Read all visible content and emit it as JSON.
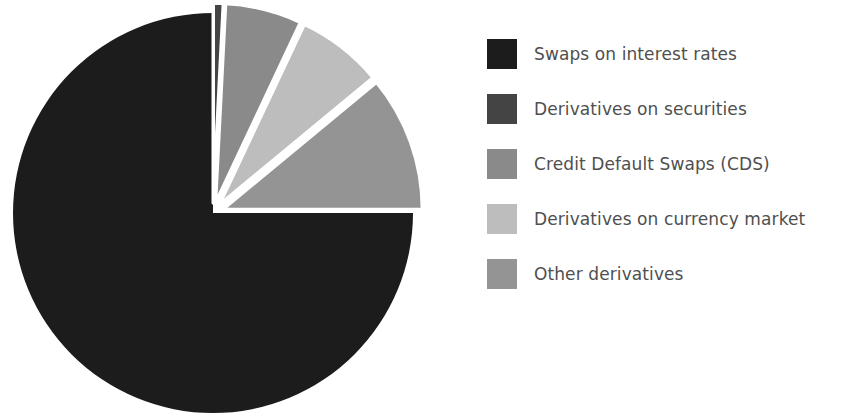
{
  "chart_data": {
    "type": "pie",
    "title": "",
    "subtitle": "",
    "xlabel": "",
    "ylabel": "",
    "grid": false,
    "legend_position": "right",
    "start_angle_deg": 0,
    "direction": "clockwise",
    "center": {
      "x": 213,
      "y": 213
    },
    "radius": 200,
    "separator_color": "#ffffff",
    "background_color": "#ffffff",
    "categories": [
      "Swaps on interest rates",
      "Derivatives on securities",
      "Credit Default Swaps (CDS)",
      "Derivatives on currency market",
      "Other derivatives"
    ],
    "values": [
      75.0,
      0.8,
      6.2,
      7.0,
      11.0
    ],
    "unit": "percent",
    "slices": [
      {
        "label": "Swaps on interest rates",
        "value": 75.0,
        "color": "#1c1c1c",
        "start_deg": 90,
        "end_deg": 360,
        "exploded": false
      },
      {
        "label": "Derivatives on securities",
        "value": 0.8,
        "color": "#444444",
        "start_deg": 0,
        "end_deg": 2.9,
        "exploded": true
      },
      {
        "label": "Credit Default Swaps (CDS)",
        "value": 6.2,
        "color": "#8a8a8a",
        "start_deg": 2.9,
        "end_deg": 25.2,
        "exploded": true
      },
      {
        "label": "Derivatives on currency market",
        "value": 7.0,
        "color": "#bdbdbd",
        "start_deg": 25.2,
        "end_deg": 50.4,
        "exploded": true
      },
      {
        "label": "Other derivatives",
        "value": 11.0,
        "color": "#949494",
        "start_deg": 50.4,
        "end_deg": 90.0,
        "exploded": true
      }
    ]
  },
  "legend": {
    "items": [
      {
        "label": "Swaps on interest rates",
        "color": "#1c1c1c"
      },
      {
        "label": "Derivatives on securities",
        "color": "#444444"
      },
      {
        "label": "Credit Default Swaps (CDS)",
        "color": "#8a8a8a"
      },
      {
        "label": "Derivatives on currency market",
        "color": "#bdbdbd"
      },
      {
        "label": "Other derivatives",
        "color": "#949494"
      }
    ],
    "text_color": "#4f4f4f"
  }
}
